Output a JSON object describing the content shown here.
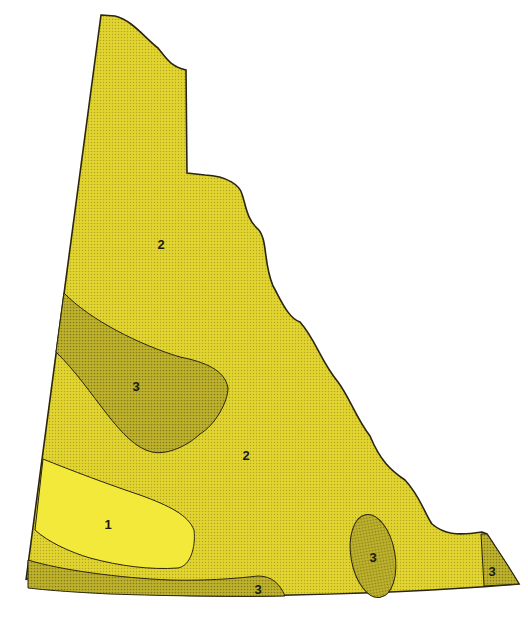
{
  "map": {
    "colors": {
      "zone1": "#f2e83a",
      "zone2": "#e0d22e",
      "zone3": "#b7ac2a",
      "outline": "#2a2510",
      "background": "#ffffff"
    },
    "labels": [
      {
        "id": "zone2-north",
        "text": "2",
        "x": 161,
        "y": 246
      },
      {
        "id": "zone3-west",
        "text": "3",
        "x": 136,
        "y": 388
      },
      {
        "id": "zone2-central",
        "text": "2",
        "x": 246,
        "y": 457
      },
      {
        "id": "zone1-southwest",
        "text": "1",
        "x": 108,
        "y": 526
      },
      {
        "id": "zone3-southeast",
        "text": "3",
        "x": 373,
        "y": 559
      },
      {
        "id": "zone3-south",
        "text": "3",
        "x": 258,
        "y": 591
      },
      {
        "id": "zone3-east-corner",
        "text": "3",
        "x": 492,
        "y": 573
      }
    ]
  }
}
